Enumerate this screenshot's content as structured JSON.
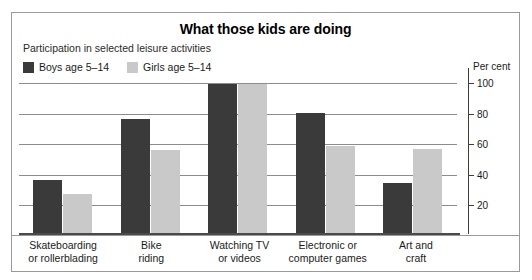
{
  "chart_data": {
    "type": "bar",
    "title": "What those kids are doing",
    "subtitle": "Participation in selected leisure activities",
    "categories": [
      "Skateboarding\nor rollerblading",
      "Bike\nriding",
      "Watching TV\nor videos",
      "Electronic or\ncomputer games",
      "Art and\ncraft"
    ],
    "series": [
      {
        "name": "Boys age 5–14",
        "values": [
          36,
          77,
          100,
          81,
          34
        ],
        "color": "#3a3a3a"
      },
      {
        "name": "Girls age 5–14",
        "values": [
          27,
          56,
          100,
          59,
          57
        ],
        "color": "#c9c9c9"
      }
    ],
    "xlabel": "",
    "ylabel": "Per cent",
    "ylim": [
      0,
      110
    ],
    "yticks": [
      100,
      80,
      60,
      40,
      20
    ],
    "grid": true,
    "legend_position": "top-left",
    "axis_position": "right"
  },
  "legend": {
    "items": [
      {
        "label": "Boys age 5–14",
        "swatch": "#3a3a3a"
      },
      {
        "label": "Girls age 5–14",
        "swatch": "#c9c9c9"
      }
    ]
  },
  "axis": {
    "unit_label": "Per cent",
    "ticks": [
      "100",
      "80",
      "60",
      "40",
      "20"
    ]
  },
  "categories": [
    {
      "line1": "Skateboarding",
      "line2": "or rollerblading"
    },
    {
      "line1": "Bike",
      "line2": "riding"
    },
    {
      "line1": "Watching TV",
      "line2": "or videos"
    },
    {
      "line1": "Electronic or",
      "line2": "computer games"
    },
    {
      "line1": "Art and",
      "line2": "craft"
    }
  ]
}
